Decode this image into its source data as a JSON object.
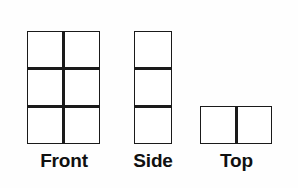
{
  "figure": {
    "background_color": "#fefefe",
    "line_color": "#1a1a1a",
    "fill_color": "#ffffff",
    "line_width_px": 3
  },
  "views": [
    {
      "name": "front",
      "label": "Front",
      "columns": 2,
      "rows": 3,
      "cell_count": 6,
      "bounds": {
        "x": 27,
        "y": 31,
        "width": 73,
        "height": 113
      }
    },
    {
      "name": "side",
      "label": "Side",
      "columns": 1,
      "rows": 3,
      "cell_count": 3,
      "bounds": {
        "x": 134,
        "y": 31,
        "width": 38,
        "height": 113
      }
    },
    {
      "name": "top",
      "label": "Top",
      "columns": 2,
      "rows": 1,
      "cell_count": 2,
      "bounds": {
        "x": 200,
        "y": 106,
        "width": 72,
        "height": 38
      }
    }
  ]
}
